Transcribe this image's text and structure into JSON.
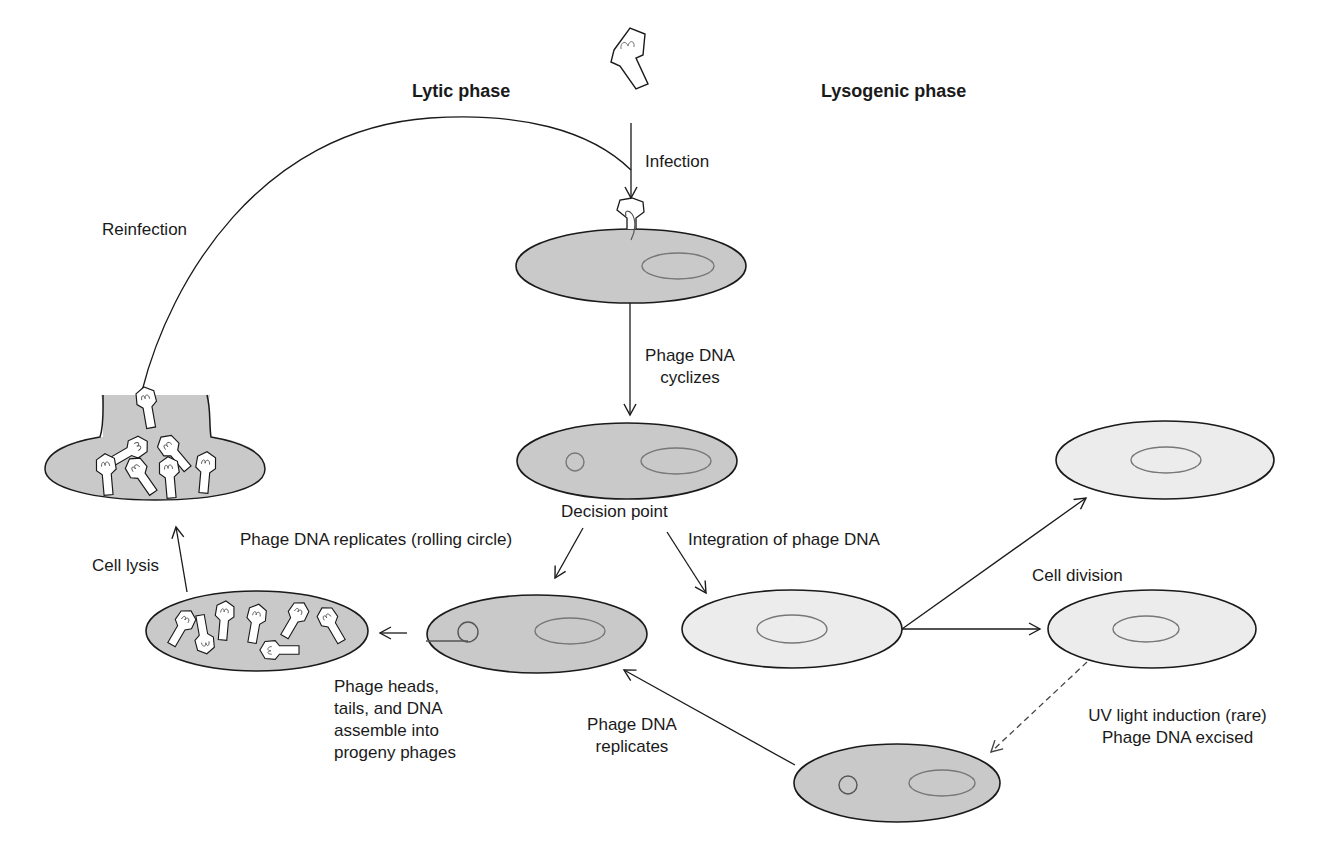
{
  "figure": {
    "phases": {
      "lytic": "Lytic phase",
      "lysogenic": "Lysogenic phase"
    },
    "labels": {
      "infection": "Infection",
      "reinfection": "Reinfection",
      "cyclizes_line1": "Phage DNA",
      "cyclizes_line2": "cyclizes",
      "decision_point": "Decision point",
      "rolling_circle": "Phage DNA replicates (rolling circle)",
      "integration": "Integration of phage DNA",
      "cell_lysis": "Cell lysis",
      "cell_division": "Cell division",
      "assemble_line1": "Phage heads,",
      "assemble_line2": "tails, and DNA",
      "assemble_line3": "assemble into",
      "assemble_line4": "progeny phages",
      "replicates_line1": "Phage DNA",
      "replicates_line2": "replicates",
      "uv_line1": "UV light induction (rare)",
      "uv_line2": "Phage DNA excised"
    },
    "colors": {
      "lytic_cell_fill": "#c9c9c9",
      "lysogenic_cell_fill": "#ececec",
      "outline": "#1a1a1a",
      "nucleoid_outline": "#777777",
      "phage_fill": "#ffffff"
    },
    "nodes": [
      {
        "id": "free-phage",
        "description": "free bacteriophage"
      },
      {
        "id": "infected-cell",
        "description": "phage attached injecting DNA"
      },
      {
        "id": "decision-cell",
        "description": "cell with circular phage DNA"
      },
      {
        "id": "rolling-circle-cell",
        "description": "cell with rolling circle replication"
      },
      {
        "id": "assembly-cell",
        "description": "cell with assembled progeny phages"
      },
      {
        "id": "lysed-cell",
        "description": "lysed cell releasing phages"
      },
      {
        "id": "lysogen-cell",
        "description": "cell with integrated prophage"
      },
      {
        "id": "daughter-cell-top",
        "description": "daughter lysogen"
      },
      {
        "id": "daughter-cell-bottom",
        "description": "daughter lysogen"
      },
      {
        "id": "induced-cell",
        "description": "cell with excised phage DNA"
      }
    ]
  }
}
